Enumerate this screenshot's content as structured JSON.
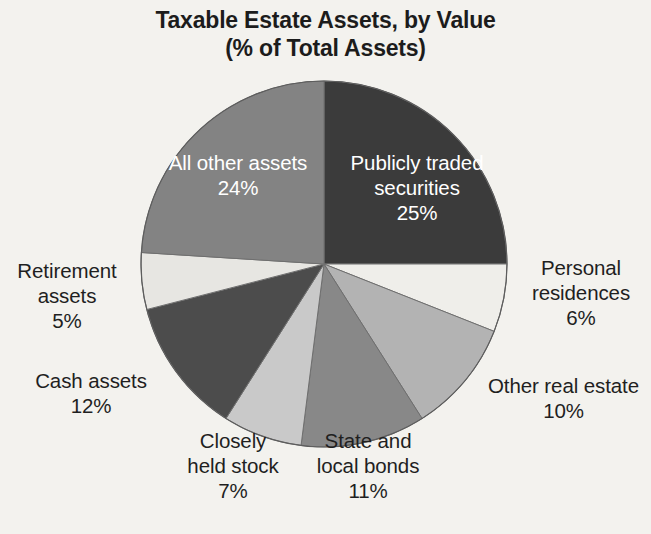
{
  "title": {
    "line1": "Taxable Estate Assets, by Value",
    "line2": "(% of Total Assets)"
  },
  "colors": {
    "background": "#f3f2ee",
    "title_text": "#1c1c1c",
    "label_text": "#1f1f1f",
    "inside_label_text": "#ffffff",
    "slice_outline": "#6f6f6f"
  },
  "labels": {
    "publicly_traded_securities": {
      "name_line1": "Publicly traded",
      "name_line2": "securities",
      "percent": "25%"
    },
    "personal_residences": {
      "name_line1": "Personal",
      "name_line2": "residences",
      "percent": "6%"
    },
    "other_real_estate": {
      "name_line1": "Other real estate",
      "percent": "10%"
    },
    "state_and_local_bonds": {
      "name_line1": "State and",
      "name_line2": "local bonds",
      "percent": "11%"
    },
    "closely_held_stock": {
      "name_line1": "Closely",
      "name_line2": "held stock",
      "percent": "7%"
    },
    "cash_assets": {
      "name_line1": "Cash assets",
      "percent": "12%"
    },
    "retirement_assets": {
      "name_line1": "Retirement",
      "name_line2": "assets",
      "percent": "5%"
    },
    "all_other_assets": {
      "name_line1": "All other assets",
      "percent": "24%"
    }
  },
  "chart_data": {
    "type": "pie",
    "title": "Taxable Estate Assets, by Value (% of Total Assets)",
    "unit": "% of Total Assets",
    "total": 100,
    "start_angle_deg": 0,
    "direction": "clockwise",
    "center": [
      324,
      264
    ],
    "radius": 183,
    "legend": "none (labels on/around slices)",
    "categories": [
      "Publicly traded securities",
      "Personal residences",
      "Other real estate",
      "State and local bonds",
      "Closely held stock",
      "Cash assets",
      "Retirement assets",
      "All other assets"
    ],
    "values": [
      25,
      6,
      10,
      11,
      7,
      12,
      5,
      24
    ],
    "slices": [
      {
        "label": "Publicly traded securities",
        "value": 25,
        "percent": "25%",
        "color": "#3b3b3b",
        "label_position": "inside"
      },
      {
        "label": "Personal residences",
        "value": 6,
        "percent": "6%",
        "color": "#efeeea",
        "label_position": "outside"
      },
      {
        "label": "Other real estate",
        "value": 10,
        "percent": "10%",
        "color": "#b3b3b3",
        "label_position": "outside"
      },
      {
        "label": "State and local bonds",
        "value": 11,
        "percent": "11%",
        "color": "#888888",
        "label_position": "outside"
      },
      {
        "label": "Closely held stock",
        "value": 7,
        "percent": "7%",
        "color": "#c9c9c9",
        "label_position": "outside"
      },
      {
        "label": "Cash assets",
        "value": 12,
        "percent": "12%",
        "color": "#4c4c4c",
        "label_position": "outside"
      },
      {
        "label": "Retirement assets",
        "value": 5,
        "percent": "5%",
        "color": "#e7e6e2",
        "label_position": "outside"
      },
      {
        "label": "All other assets",
        "value": 24,
        "percent": "24%",
        "color": "#838383",
        "label_position": "inside"
      }
    ]
  }
}
